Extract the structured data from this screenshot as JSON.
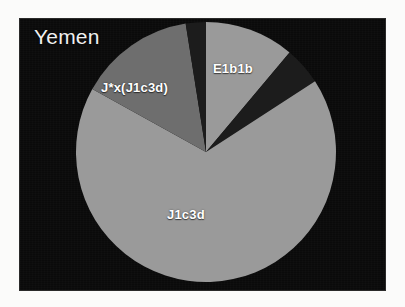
{
  "figure": {
    "panel_background": "#0a0a0a",
    "outer_background": "#fbfbfa"
  },
  "chart_data": {
    "type": "pie",
    "title": "Yemen",
    "xlabel": "",
    "ylabel": "",
    "legend_position": "none",
    "grid": false,
    "labels_inside": true,
    "start_angle_deg": 0,
    "direction": "clockwise",
    "categories": [
      "E1b1b",
      "unlabeled-dark-wedge",
      "J1c3d",
      "J*x(J1c3d)",
      "unlabeled-dark-sliver"
    ],
    "values": [
      11.1,
      4.7,
      67.2,
      14.4,
      2.6
    ],
    "slices": [
      {
        "label": "E1b1b",
        "value": 11.1,
        "color": "#9a9a9a",
        "start_deg": 0,
        "end_deg": 40,
        "label_x": 193,
        "label_y": 42
      },
      {
        "label": "",
        "value": 4.7,
        "color": "#1c1c1c",
        "start_deg": 40,
        "end_deg": 57,
        "label_x": 0,
        "label_y": 0
      },
      {
        "label": "J1c3d",
        "value": 67.2,
        "color": "#9a9a9a",
        "start_deg": 57,
        "end_deg": 299,
        "label_x": 147,
        "label_y": 188
      },
      {
        "label": "J*x(J1c3d)",
        "value": 14.4,
        "color": "#6e6e6e",
        "start_deg": 299,
        "end_deg": 351,
        "label_x": 81,
        "label_y": 61
      },
      {
        "label": "",
        "value": 2.6,
        "color": "#1c1c1c",
        "start_deg": 351,
        "end_deg": 360,
        "label_x": 0,
        "label_y": 0
      }
    ],
    "geometry": {
      "center_x": 186,
      "center_y": 133,
      "radius": 130
    },
    "colors": {
      "light_gray": "#9a9a9a",
      "medium_gray": "#6e6e6e",
      "dark": "#1c1c1c",
      "label_text": "#ffffff",
      "title_text": "#f0f0f0"
    }
  }
}
